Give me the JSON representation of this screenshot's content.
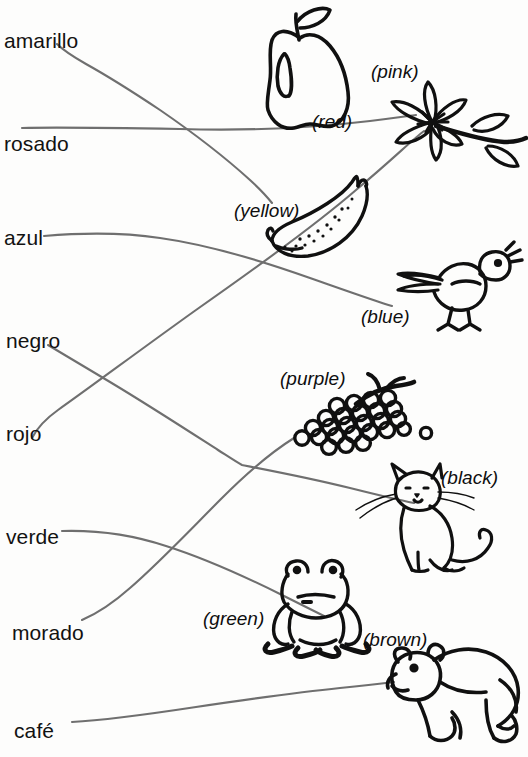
{
  "worksheet": {
    "type": "matching-exercise",
    "description": "Spanish color words connected by hand-drawn lines to pictures labelled with English colors",
    "width": 528,
    "height": 757,
    "background_color": "#fdfdfc",
    "ink_color": "#6f6f6f",
    "text_color": "#121212"
  },
  "spanish_terms": [
    {
      "label": "amarillo",
      "x": 4,
      "y": 30
    },
    {
      "label": "rosado",
      "x": 4,
      "y": 133
    },
    {
      "label": "azul",
      "x": 4,
      "y": 227
    },
    {
      "label": "negro",
      "x": 6,
      "y": 330
    },
    {
      "label": "rojo",
      "x": 6,
      "y": 423
    },
    {
      "label": "verde",
      "x": 6,
      "y": 526
    },
    {
      "label": "morado",
      "x": 12,
      "y": 622
    },
    {
      "label": "café",
      "x": 14,
      "y": 720
    }
  ],
  "english_terms": [
    {
      "label": "(pink)",
      "x": 371,
      "y": 62,
      "picture": "flower"
    },
    {
      "label": "(red)",
      "x": 312,
      "y": 112,
      "picture": "apple"
    },
    {
      "label": "(yellow)",
      "x": 234,
      "y": 201,
      "picture": "banana"
    },
    {
      "label": "(blue)",
      "x": 361,
      "y": 307,
      "picture": "bird"
    },
    {
      "label": "(purple)",
      "x": 280,
      "y": 369,
      "picture": "grapes"
    },
    {
      "label": "(black)",
      "x": 441,
      "y": 468,
      "picture": "cat"
    },
    {
      "label": "(green)",
      "x": 203,
      "y": 609,
      "picture": "frog"
    },
    {
      "label": "(brown)",
      "x": 363,
      "y": 630,
      "picture": "bear"
    }
  ],
  "pictures": [
    {
      "name": "apple-drawing",
      "english": "(red)"
    },
    {
      "name": "flower-drawing",
      "english": "(pink)"
    },
    {
      "name": "banana-drawing",
      "english": "(yellow)"
    },
    {
      "name": "bird-drawing",
      "english": "(blue)"
    },
    {
      "name": "grapes-drawing",
      "english": "(purple)"
    },
    {
      "name": "cat-drawing",
      "english": "(black)"
    },
    {
      "name": "frog-drawing",
      "english": "(green)"
    },
    {
      "name": "bear-drawing",
      "english": "(brown)"
    }
  ],
  "connections": [
    {
      "from": "amarillo",
      "to": "(yellow)"
    },
    {
      "from": "rosado",
      "to": "(pink)"
    },
    {
      "from": "azul",
      "to": "(blue)"
    },
    {
      "from": "negro",
      "to": "(black)"
    },
    {
      "from": "rojo",
      "to": "(red)"
    },
    {
      "from": "verde",
      "to": "(green)"
    },
    {
      "from": "morado",
      "to": "(purple)"
    },
    {
      "from": "café",
      "to": "(brown)"
    }
  ]
}
